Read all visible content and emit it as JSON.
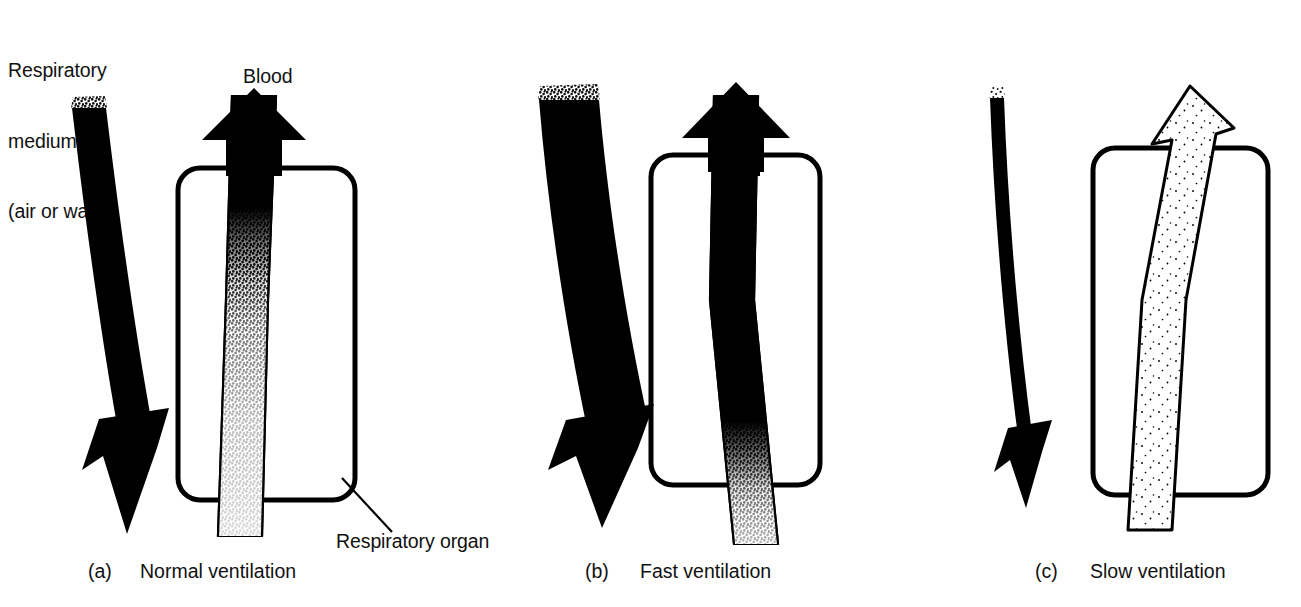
{
  "figure": {
    "labels": {
      "medium": "Respiratory\nmedium\n(air or water)",
      "medium_line1": "Respiratory",
      "medium_line2": "medium",
      "medium_line3": "(air or water)",
      "blood": "Blood",
      "organ": "Respiratory organ"
    },
    "colors": {
      "ink": "#000000",
      "background": "#ffffff",
      "stipple": "#000000"
    },
    "panels": [
      {
        "id": "a",
        "tag": "(a)",
        "caption": "Normal ventilation",
        "medium_flow": "normal",
        "medium_arrow_width": 34,
        "medium_arrow_fill": "solid-black",
        "blood_arrow_fill": "gradient-black-to-stipple",
        "blood_arrow_width": 44,
        "oxygenation_transition": "upper-third-of-organ",
        "organ_box": "rounded-rectangle"
      },
      {
        "id": "b",
        "tag": "(b)",
        "caption": "Fast ventilation",
        "medium_flow": "fast",
        "medium_arrow_width": 60,
        "medium_arrow_fill": "solid-black",
        "blood_arrow_fill": "gradient-black-to-stipple",
        "blood_arrow_width": 44,
        "oxygenation_transition": "bottom-of-organ",
        "organ_box": "rounded-rectangle"
      },
      {
        "id": "c",
        "tag": "(c)",
        "caption": "Slow ventilation",
        "medium_flow": "slow",
        "medium_arrow_width": 14,
        "medium_arrow_fill": "solid-black",
        "blood_arrow_fill": "outline-stipple",
        "blood_arrow_width": 46,
        "oxygenation_transition": "none",
        "organ_box": "rounded-rectangle"
      }
    ]
  }
}
